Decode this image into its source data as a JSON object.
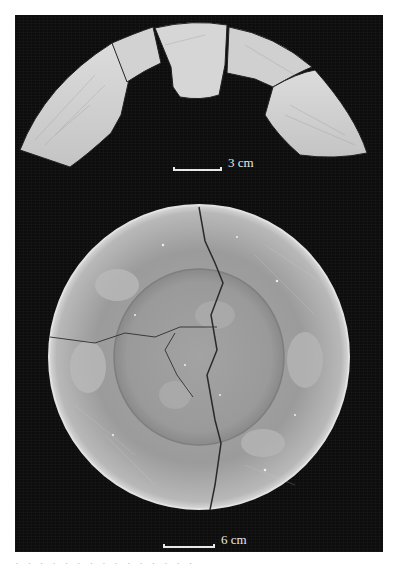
{
  "figure": {
    "top_panel": {
      "subject": "rim sherds arranged in arc",
      "scale_label": "3 cm"
    },
    "bottom_panel": {
      "subject": "cracked shallow bowl, top view",
      "scale_label": "6 cm"
    },
    "background_color": "#0d0d0d",
    "object_color": "#c9c9c9"
  },
  "caption": {
    "text": "· · · · · · · · · · · · · · ·"
  }
}
